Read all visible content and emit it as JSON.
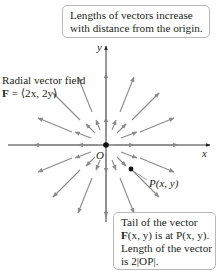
{
  "diagram": {
    "title": "Radial vector field",
    "field_definition": {
      "bold": "F",
      "rest": " = ⟨2x, 2y⟩"
    },
    "top_callout": {
      "line1": "Lengths of vectors increase",
      "line2": "with distance from the origin."
    },
    "bottom_callout": {
      "line1": "Tail of the vector",
      "line2_bold": "F",
      "line2_rest": "(x, y) is at P(x, y).",
      "line3": "Length of the vector",
      "line4": "is 2|OP|."
    },
    "point_label": "P(x, y)",
    "origin_label": "O",
    "x_axis_label": "x",
    "y_axis_label": "y",
    "colors": {
      "arrow": "#8a8a8c",
      "axis": "#231f20",
      "callout_border": "#b9b9b9"
    }
  }
}
